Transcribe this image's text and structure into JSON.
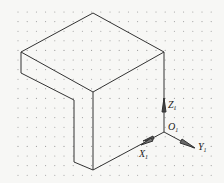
{
  "diagram": {
    "type": "isometric-drawing",
    "background": "#f7f7f5",
    "line_color": "#333333",
    "grid": {
      "type": "dot",
      "spacing_x": 9.2,
      "spacing_y": 9.6,
      "color": "#9a9a9a"
    },
    "axes": {
      "origin": {
        "label": "O",
        "sub": "1"
      },
      "z": {
        "label": "Z",
        "sub": "1"
      },
      "x": {
        "label": "X",
        "sub": "1"
      },
      "y": {
        "label": "Y",
        "sub": "1"
      }
    },
    "object": {
      "name": "L-shaped block",
      "vertices": {
        "top_apex": [
          93,
          13
        ],
        "left_corner": [
          21,
          52
        ],
        "right_corner": [
          164,
          52
        ],
        "front_top": [
          93,
          92
        ],
        "left_lower": [
          21,
          73
        ],
        "notch_top": [
          74,
          100
        ],
        "notch_bottom": [
          74,
          162
        ],
        "front_bottom": [
          93,
          170
        ],
        "origin": [
          164,
          132
        ]
      }
    }
  }
}
